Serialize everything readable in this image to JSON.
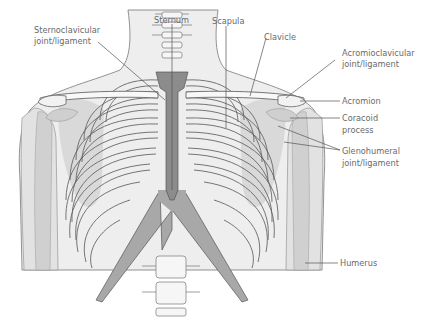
{
  "figure": {
    "type": "anatomical illustration",
    "colors": {
      "background": "#ffffff",
      "body_silhouette": "#ececec",
      "bone_light": "#f6f6f6",
      "bone_mid": "#d4d4d4",
      "scapula_shade": "#c9c9c9",
      "sternum": "#8c8c8c",
      "cartilage": "#a6a6a6",
      "outline": "#666666",
      "label_text": "#6a6a6a",
      "leader_line": "#555555"
    }
  },
  "labels": [
    {
      "id": "sternoclavicular",
      "line1": "Sternoclavicular",
      "line2": "joint/ligament"
    },
    {
      "id": "sternum",
      "line1": "Sternum"
    },
    {
      "id": "scapula",
      "line1": "Scapula"
    },
    {
      "id": "clavicle",
      "line1": "Clavicle"
    },
    {
      "id": "acromioclavicular",
      "line1": "Acromioclavicular",
      "line2": "joint/ligament"
    },
    {
      "id": "acromion",
      "line1": "Acromion"
    },
    {
      "id": "coracoid",
      "line1": "Coracoid",
      "line2": "process"
    },
    {
      "id": "glenohumeral",
      "line1": "Glenohumeral",
      "line2": "joint/ligament"
    },
    {
      "id": "humerus",
      "line1": "Humerus"
    }
  ]
}
